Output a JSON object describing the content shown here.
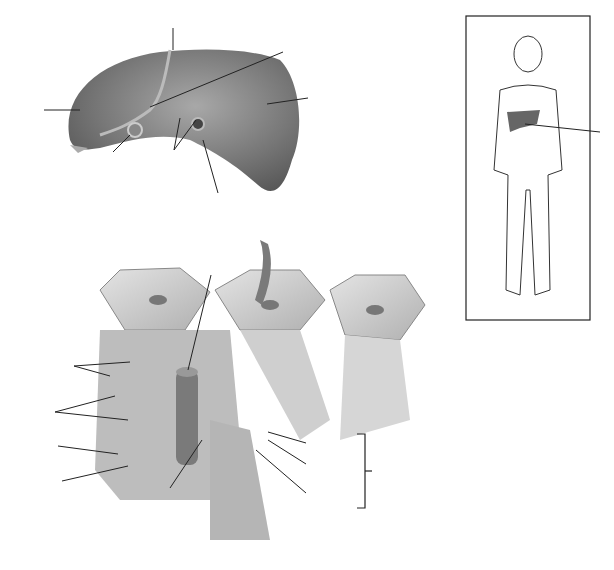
{
  "figure": {
    "type": "unlabeled anatomy diagram",
    "panels": [
      "liver-anterior-view",
      "body-outline-inset",
      "liver-lobule-cutaway"
    ]
  },
  "colors": {
    "organ": "#6e6e6e",
    "organ_light": "#9a9a9a",
    "lobule_face": "#d8d8d8",
    "lobule_side": "#c4c4c4",
    "vessel": "#707070",
    "arrow": "#7a7a7a",
    "line": "#222222"
  },
  "labels": {
    "liver": [
      "",
      "",
      "",
      "",
      "",
      "",
      ""
    ],
    "inset": [
      ""
    ],
    "lobule": [
      "",
      "",
      "",
      "",
      "",
      "",
      "",
      "",
      "",
      ""
    ],
    "bracket": [
      ""
    ]
  }
}
